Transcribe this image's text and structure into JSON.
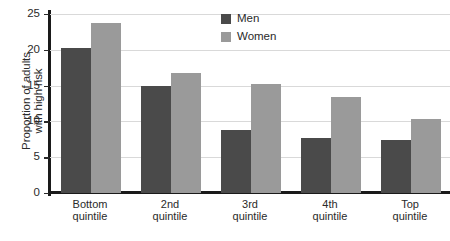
{
  "chart_data": {
    "type": "bar",
    "title": "",
    "subtitle": "",
    "xlabel": "",
    "ylabel": "Proportion of adults with high risk",
    "ylabel_lines": [
      "Proportion of adults",
      "with high risk"
    ],
    "categories": [
      "Bottom quintile",
      "2nd quintile",
      "3rd quintile",
      "4th quintile",
      "Top quintile"
    ],
    "category_lines": [
      [
        "Bottom",
        "quintile"
      ],
      [
        "2nd",
        "quintile"
      ],
      [
        "3rd",
        "quintile"
      ],
      [
        "4th",
        "quintile"
      ],
      [
        "Top",
        "quintile"
      ]
    ],
    "series": [
      {
        "name": "Men",
        "color": "#4a4a4a",
        "values": [
          20.2,
          15.0,
          8.8,
          7.7,
          7.4
        ]
      },
      {
        "name": "Women",
        "color": "#9a9a9a",
        "values": [
          23.7,
          16.8,
          15.2,
          13.4,
          10.4
        ]
      }
    ],
    "ylim": [
      0,
      25
    ],
    "yticks": [
      0,
      5,
      10,
      15,
      20,
      25
    ],
    "ytick_labels": [
      "0",
      "5",
      "10",
      "15",
      "20",
      "25"
    ],
    "grid": true,
    "grid_axis": "y",
    "legend_position": "top-center-right",
    "axis_color": "#1a1a1a",
    "grid_color": "#d9d9d9",
    "background_color": "#ffffff"
  }
}
